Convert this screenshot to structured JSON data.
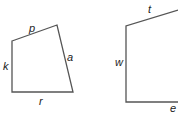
{
  "figures": [
    {
      "name": "quadrilateral",
      "labels": {
        "top": "p",
        "left": "k",
        "right": "a",
        "bottom": "r"
      }
    },
    {
      "name": "open-figure",
      "labels": {
        "top": "t",
        "left": "w",
        "bottom": "e"
      }
    }
  ],
  "colors": {
    "stroke": "#555555",
    "text": "#222222",
    "background": "#ffffff"
  }
}
